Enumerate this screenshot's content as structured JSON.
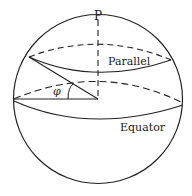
{
  "diagram": {
    "title": "",
    "labels": {
      "pole": "P",
      "parallel": "Parallel",
      "equator": "Equator",
      "angle": "φ"
    },
    "colors": {
      "stroke": "#222222",
      "background": "#ffffff"
    }
  }
}
